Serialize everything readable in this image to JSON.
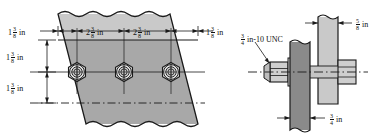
{
  "drawing": {
    "title": "Bolted lap joint detail",
    "colors": {
      "plate_light": "#c9c9c9",
      "plate_main": "#a8a8a8",
      "plate_dark": "#8a8a8a",
      "nut_light": "#d8d8d8",
      "line": "#1a1a1a",
      "background": "#ffffff"
    },
    "left_view": {
      "name": "plan-view-bolt-row",
      "bolt_count": 3,
      "horizontal_dimensions": [
        {
          "whole": "1",
          "num": "3",
          "den": "8",
          "unit": "in",
          "position": "edge-to-first-bolt"
        },
        {
          "whole": "2",
          "num": "3",
          "den": "8",
          "unit": "in",
          "position": "bolt-1-to-bolt-2"
        },
        {
          "whole": "2",
          "num": "3",
          "den": "8",
          "unit": "in",
          "position": "bolt-2-to-bolt-3"
        },
        {
          "whole": "1",
          "num": "3",
          "den": "8",
          "unit": "in",
          "position": "bolt-3-to-edge"
        }
      ],
      "vertical_dimensions": [
        {
          "whole": "1",
          "num": "3",
          "den": "8",
          "unit": "in",
          "position": "top-edge-to-bolt-axis"
        },
        {
          "whole": "1",
          "num": "3",
          "den": "8",
          "unit": "in",
          "position": "bolt-axis-to-centerline"
        }
      ]
    },
    "right_view": {
      "name": "section-view-bolt-assembly",
      "thread_callout": {
        "whole": "",
        "num": "3",
        "den": "4",
        "unit": "in-10 UNC"
      },
      "dimensions": [
        {
          "whole": "",
          "num": "5",
          "den": "8",
          "unit": "in",
          "position": "light-plate-thickness"
        },
        {
          "whole": "",
          "num": "3",
          "den": "4",
          "unit": "in",
          "position": "dark-plate-thickness"
        }
      ]
    }
  }
}
